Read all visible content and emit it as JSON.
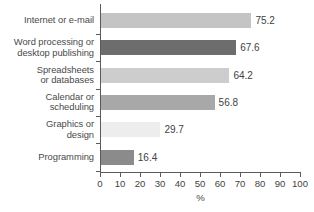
{
  "chart_data": {
    "type": "bar",
    "orientation": "horizontal",
    "title": "",
    "xlabel": "%",
    "ylabel": "",
    "xlim": [
      0,
      100
    ],
    "xticks": [
      0,
      10,
      20,
      30,
      40,
      50,
      60,
      70,
      80,
      90,
      100
    ],
    "xtick_labels": [
      "0",
      "10",
      "20",
      "30",
      "40",
      "50",
      "60",
      "70",
      "80",
      "90",
      "100"
    ],
    "grid": false,
    "legend": false,
    "categories": [
      "Internet or e-mail",
      "Word processing or desktop publishing",
      "Spreadsheets or databases",
      "Calendar or scheduling",
      "Graphics or design",
      "Programming"
    ],
    "values": [
      75.2,
      67.6,
      64.2,
      56.8,
      29.7,
      16.4
    ],
    "value_labels": [
      "75.2",
      "67.6",
      "64.2",
      "56.8",
      "29.7",
      "16.4"
    ],
    "bar_colors": [
      "#c4c4c4",
      "#6d6d6d",
      "#cdcdcd",
      "#a8a8a8",
      "#ededed",
      "#8b8b8b"
    ]
  },
  "bars": [
    {
      "label_lines": [
        "Internet or e-mail"
      ],
      "value": 75.2,
      "value_label": "75.2",
      "color": "#c4c4c4"
    },
    {
      "label_lines": [
        "Word processing or",
        "desktop publishing"
      ],
      "value": 67.6,
      "value_label": "67.6",
      "color": "#6d6d6d"
    },
    {
      "label_lines": [
        "Spreadsheets",
        "or databases"
      ],
      "value": 64.2,
      "value_label": "64.2",
      "color": "#cdcdcd"
    },
    {
      "label_lines": [
        "Calendar or",
        "scheduling"
      ],
      "value": 56.8,
      "value_label": "56.8",
      "color": "#a8a8a8"
    },
    {
      "label_lines": [
        "Graphics or",
        "design"
      ],
      "value": 29.7,
      "value_label": "29.7",
      "color": "#ededed"
    },
    {
      "label_lines": [
        "Programming"
      ],
      "value": 16.4,
      "value_label": "16.4",
      "color": "#8b8b8b"
    }
  ],
  "axis": {
    "x_title": "%",
    "ticks": [
      "0",
      "10",
      "20",
      "30",
      "40",
      "50",
      "60",
      "70",
      "80",
      "90",
      "100"
    ]
  },
  "colors": {
    "axis": "#5a5a5a",
    "text": "#3f3f3f",
    "background": "#ffffff"
  }
}
